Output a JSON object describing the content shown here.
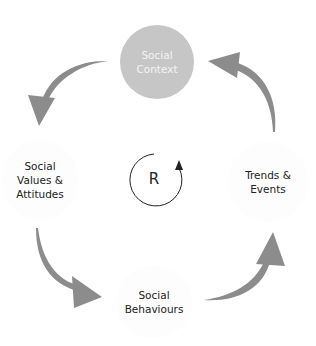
{
  "diagram": {
    "type": "reinforcing-loop",
    "nodes": [
      {
        "id": "top",
        "label": "Social\nContext",
        "fill": "#c6c6c6",
        "text_color": "#f4f4f4"
      },
      {
        "id": "right",
        "label": "Trends &\nEvents",
        "fill": "#ffffff",
        "text_color": "#222222"
      },
      {
        "id": "bottom",
        "label": "Social\nBehaviours",
        "fill": "#ffffff",
        "text_color": "#222222"
      },
      {
        "id": "left",
        "label": "Social\nValues &\nAttitudes",
        "fill": "#ffffff",
        "text_color": "#222222"
      }
    ],
    "loop_label": "R",
    "arrow_color": "#8c8c8c",
    "edges": [
      {
        "from": "top",
        "to": "left"
      },
      {
        "from": "left",
        "to": "bottom"
      },
      {
        "from": "bottom",
        "to": "right"
      },
      {
        "from": "right",
        "to": "top"
      }
    ]
  }
}
